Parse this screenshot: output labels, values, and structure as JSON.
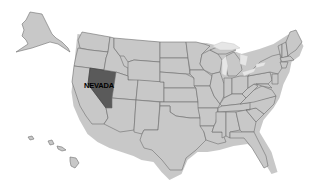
{
  "map": {
    "title": "United States",
    "highlighted_state": {
      "name": "Nevada",
      "label": "NEVADA",
      "color": "#5a5a5a"
    },
    "default_state_color": "#c8c8c8",
    "border_color": "#6f6f6f",
    "background": "#ffffff",
    "insets": [
      "Alaska",
      "Hawaii"
    ]
  }
}
